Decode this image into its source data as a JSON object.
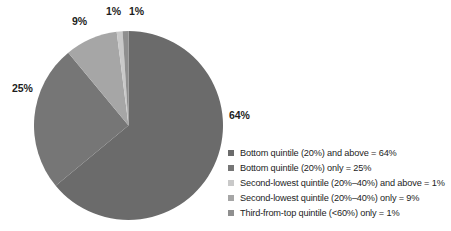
{
  "chart_data": {
    "type": "pie",
    "title": "",
    "subtitle": "",
    "xlabel": "",
    "ylabel": "",
    "legend_position": "right",
    "grid": false,
    "start_angle_deg": 0,
    "direction": "clockwise",
    "categories": [
      "Bottom quintile (20%) and above",
      "Bottom quintile (20%) only",
      "Second-lowest quintile (20%–40%) and above",
      "Second-lowest quintile (20%–40%) only",
      "Third-from-top quintile (<60%) only"
    ],
    "values": [
      64,
      25,
      1,
      9,
      1
    ],
    "unit": "%",
    "slice_draw_order": [
      {
        "key": "bottom-and-above",
        "value": 64,
        "color": "#6b6b6b"
      },
      {
        "key": "bottom-only",
        "value": 25,
        "color": "#767676"
      },
      {
        "key": "second-lowest-only",
        "value": 9,
        "color": "#a6a6a6"
      },
      {
        "key": "second-lowest-and-above",
        "value": 1,
        "color": "#c9c9c9"
      },
      {
        "key": "third-from-top-only",
        "value": 1,
        "color": "#8f8f8f"
      }
    ],
    "data_labels": [
      "64%",
      "25%",
      "9%",
      "1%",
      "1%"
    ],
    "colors": [
      "#6b6b6b",
      "#767676",
      "#c9c9c9",
      "#a6a6a6",
      "#8f8f8f"
    ]
  },
  "pie": {
    "labels": {
      "p64": "64%",
      "p25": "25%",
      "p9": "9%",
      "p1a": "1%",
      "p1b": "1%"
    }
  },
  "legend": {
    "items": [
      {
        "label": "Bottom quintile (20%) and above = 64%",
        "color": "#6b6b6b",
        "value": 64
      },
      {
        "label": "Bottom quintile (20%) only = 25%",
        "color": "#767676",
        "value": 25
      },
      {
        "label": "Second-lowest quintile (20%–40%) and above = 1%",
        "color": "#c9c9c9",
        "value": 1
      },
      {
        "label": "Second-lowest quintile (20%–40%) only = 9%",
        "color": "#a6a6a6",
        "value": 9
      },
      {
        "label": "Third-from-top quintile (<60%) only = 1%",
        "color": "#8f8f8f",
        "value": 1
      }
    ]
  }
}
